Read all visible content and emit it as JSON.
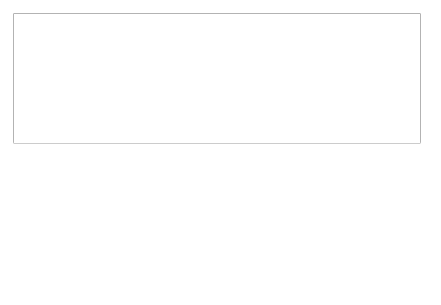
{
  "quadrant_notes": {
    "top_left": "teaching as state-mandated mission",
    "top_right": "teaching as financial necessity",
    "bottom_left": "meeting public needs",
    "bottom_right": "teaching follows research"
  },
  "axis_labels": {
    "top": "teaching led",
    "bottom": "research led",
    "left": "state direction",
    "right": "market"
  },
  "institutions": [
    {
      "label": "Plymouth, UK",
      "arrow": "left"
    },
    {
      "label": "Lapland",
      "arrow": "left"
    },
    {
      "label": "AMU, Poland",
      "arrow": "up-right"
    },
    {
      "label": "PUE Poland",
      "arrow": "right"
    },
    {
      "label": "UAL Spain",
      "arrow": "up-right"
    },
    {
      "label": "UPV Spain",
      "arrow": "down-right"
    },
    {
      "label": "Notts, UK",
      "arrow": "down-right"
    },
    {
      "label": "LSHTM, UK",
      "arrow": "down-right"
    }
  ],
  "colors": {
    "axis_label_fill": "#c8c8c8",
    "line": "#555555",
    "frame": "#888888"
  }
}
